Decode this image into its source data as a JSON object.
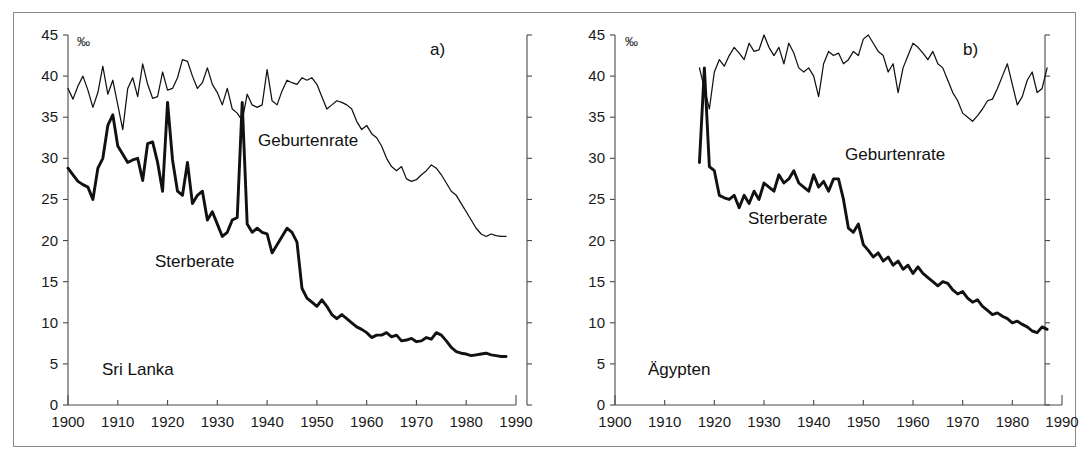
{
  "figure": {
    "unit_symbol": "‰",
    "panel_a_marker": "a)",
    "panel_b_marker": "b)",
    "series_label_birth": "Geburtenrate",
    "series_label_death": "Sterberate",
    "country_a": "Sri Lanka",
    "country_b": "Ägypten",
    "ink_color": "#111111",
    "axis_color": "#4a4a4a",
    "frame_color": "#8a8a8a",
    "background": "#ffffff"
  },
  "chart_data": [
    {
      "type": "line",
      "title": "Sri Lanka",
      "panel": "a)",
      "xlabel": "",
      "ylabel": "‰",
      "xlim": [
        1900,
        1990
      ],
      "ylim": [
        0,
        45
      ],
      "yticks": [
        0,
        5,
        10,
        15,
        20,
        25,
        30,
        35,
        40,
        45
      ],
      "xticks": [
        1900,
        1910,
        1920,
        1930,
        1940,
        1950,
        1960,
        1970,
        1980,
        1990
      ],
      "grid": false,
      "legend": "inline-annotation",
      "series": [
        {
          "name": "Geburtenrate",
          "x": [
            1900,
            1901,
            1902,
            1903,
            1904,
            1905,
            1906,
            1907,
            1908,
            1909,
            1910,
            1911,
            1912,
            1913,
            1914,
            1915,
            1916,
            1917,
            1918,
            1919,
            1920,
            1921,
            1922,
            1923,
            1924,
            1925,
            1926,
            1927,
            1928,
            1929,
            1930,
            1931,
            1932,
            1933,
            1934,
            1935,
            1936,
            1937,
            1938,
            1939,
            1940,
            1941,
            1942,
            1943,
            1944,
            1945,
            1946,
            1947,
            1948,
            1949,
            1950,
            1951,
            1952,
            1953,
            1954,
            1955,
            1956,
            1957,
            1958,
            1959,
            1960,
            1961,
            1962,
            1963,
            1964,
            1965,
            1966,
            1967,
            1968,
            1969,
            1970,
            1971,
            1972,
            1973,
            1974,
            1975,
            1976,
            1977,
            1978,
            1979,
            1980,
            1981,
            1982,
            1983,
            1984,
            1985,
            1986,
            1987,
            1988
          ],
          "values": [
            38.5,
            37.2,
            38.8,
            40.0,
            38.3,
            36.2,
            38.0,
            41.2,
            37.8,
            39.5,
            36.5,
            33.5,
            38.5,
            39.8,
            37.5,
            41.5,
            39.0,
            37.3,
            37.5,
            40.5,
            38.3,
            38.5,
            39.8,
            42.0,
            41.8,
            40.0,
            38.5,
            39.2,
            41.0,
            39.0,
            38.0,
            36.5,
            38.5,
            36.0,
            35.5,
            34.6,
            37.8,
            36.5,
            36.2,
            36.5,
            40.8,
            37.0,
            36.5,
            38.2,
            39.5,
            39.2,
            39.0,
            39.8,
            39.5,
            39.8,
            39.0,
            37.5,
            36.0,
            36.5,
            37.0,
            36.8,
            36.5,
            36.0,
            34.5,
            33.5,
            34.0,
            33.0,
            32.5,
            31.5,
            30.0,
            29.0,
            28.5,
            29.0,
            27.5,
            27.2,
            27.4,
            28.0,
            28.5,
            29.2,
            28.8,
            28.0,
            27.0,
            26.0,
            25.5,
            24.5,
            23.5,
            22.5,
            21.5,
            20.8,
            20.5,
            20.8,
            20.6,
            20.5,
            20.5
          ]
        },
        {
          "name": "Sterberate",
          "x": [
            1900,
            1901,
            1902,
            1903,
            1904,
            1905,
            1906,
            1907,
            1908,
            1909,
            1910,
            1911,
            1912,
            1913,
            1914,
            1915,
            1916,
            1917,
            1918,
            1919,
            1920,
            1921,
            1922,
            1923,
            1924,
            1925,
            1926,
            1927,
            1928,
            1929,
            1930,
            1931,
            1932,
            1933,
            1934,
            1935,
            1936,
            1937,
            1938,
            1939,
            1940,
            1941,
            1942,
            1943,
            1944,
            1945,
            1946,
            1947,
            1948,
            1949,
            1950,
            1951,
            1952,
            1953,
            1954,
            1955,
            1956,
            1957,
            1958,
            1959,
            1960,
            1961,
            1962,
            1963,
            1964,
            1965,
            1966,
            1967,
            1968,
            1969,
            1970,
            1971,
            1972,
            1973,
            1974,
            1975,
            1976,
            1977,
            1978,
            1979,
            1980,
            1981,
            1982,
            1983,
            1984,
            1985,
            1986,
            1987,
            1988
          ],
          "values": [
            28.8,
            28.0,
            27.2,
            26.8,
            26.5,
            25.0,
            28.8,
            30.0,
            34.0,
            35.3,
            31.5,
            30.5,
            29.5,
            29.8,
            30.0,
            27.3,
            31.8,
            32.0,
            29.5,
            26.0,
            36.8,
            29.8,
            26.0,
            25.5,
            29.5,
            24.5,
            25.5,
            26.0,
            22.5,
            23.5,
            22.0,
            20.5,
            21.0,
            22.5,
            22.8,
            36.8,
            22.0,
            21.0,
            21.5,
            21.0,
            20.8,
            18.5,
            19.5,
            20.5,
            21.5,
            21.0,
            19.8,
            14.2,
            13.0,
            12.5,
            12.0,
            12.8,
            12.0,
            11.0,
            10.5,
            11.0,
            10.5,
            10.0,
            9.5,
            9.2,
            8.8,
            8.2,
            8.5,
            8.5,
            8.8,
            8.3,
            8.5,
            7.8,
            7.9,
            8.1,
            7.7,
            7.8,
            8.2,
            8.0,
            8.8,
            8.5,
            7.8,
            7.0,
            6.5,
            6.3,
            6.2,
            6.0,
            6.1,
            6.2,
            6.3,
            6.1,
            6.0,
            5.9,
            5.9
          ]
        }
      ]
    },
    {
      "type": "line",
      "title": "Ägypten",
      "panel": "b)",
      "xlabel": "",
      "ylabel": "‰",
      "xlim": [
        1900,
        1990
      ],
      "ylim": [
        0,
        45
      ],
      "yticks": [
        0,
        5,
        10,
        15,
        20,
        25,
        30,
        35,
        40,
        45
      ],
      "xticks": [
        1900,
        1910,
        1920,
        1930,
        1940,
        1950,
        1960,
        1970,
        1980,
        1990
      ],
      "grid": false,
      "legend": "inline-annotation",
      "series": [
        {
          "name": "Geburtenrate",
          "x": [
            1917,
            1918,
            1919,
            1920,
            1921,
            1922,
            1923,
            1924,
            1925,
            1926,
            1927,
            1928,
            1929,
            1930,
            1931,
            1932,
            1933,
            1934,
            1935,
            1936,
            1937,
            1938,
            1939,
            1940,
            1941,
            1942,
            1943,
            1944,
            1945,
            1946,
            1947,
            1948,
            1949,
            1950,
            1951,
            1952,
            1953,
            1954,
            1955,
            1956,
            1957,
            1958,
            1959,
            1960,
            1961,
            1962,
            1963,
            1964,
            1965,
            1966,
            1967,
            1968,
            1969,
            1970,
            1971,
            1972,
            1973,
            1974,
            1975,
            1976,
            1977,
            1978,
            1979,
            1980,
            1981,
            1982,
            1983,
            1984,
            1985,
            1986,
            1987
          ],
          "values": [
            41.0,
            38.5,
            36.0,
            40.5,
            42.0,
            41.2,
            42.5,
            43.5,
            42.8,
            42.0,
            44.0,
            43.0,
            43.2,
            45.0,
            43.5,
            42.5,
            43.5,
            41.5,
            44.0,
            42.8,
            41.0,
            40.5,
            41.0,
            40.0,
            37.5,
            41.5,
            43.0,
            42.5,
            42.8,
            41.5,
            42.0,
            43.0,
            42.5,
            44.5,
            45.0,
            44.0,
            43.0,
            42.5,
            40.5,
            41.5,
            38.0,
            41.0,
            42.5,
            44.0,
            43.5,
            42.8,
            42.0,
            43.0,
            41.5,
            41.0,
            39.5,
            38.0,
            37.0,
            35.5,
            35.0,
            34.5,
            35.2,
            36.0,
            37.0,
            37.2,
            38.5,
            40.0,
            41.5,
            39.0,
            36.5,
            37.5,
            39.5,
            40.5,
            38.0,
            38.5,
            41.0
          ]
        },
        {
          "name": "Sterberate",
          "x": [
            1917,
            1918,
            1919,
            1920,
            1921,
            1922,
            1923,
            1924,
            1925,
            1926,
            1927,
            1928,
            1929,
            1930,
            1931,
            1932,
            1933,
            1934,
            1935,
            1936,
            1937,
            1938,
            1939,
            1940,
            1941,
            1942,
            1943,
            1944,
            1945,
            1946,
            1947,
            1948,
            1949,
            1950,
            1951,
            1952,
            1953,
            1954,
            1955,
            1956,
            1957,
            1958,
            1959,
            1960,
            1961,
            1962,
            1963,
            1964,
            1965,
            1966,
            1967,
            1968,
            1969,
            1970,
            1971,
            1972,
            1973,
            1974,
            1975,
            1976,
            1977,
            1978,
            1979,
            1980,
            1981,
            1982,
            1983,
            1984,
            1985,
            1986,
            1987
          ],
          "values": [
            29.5,
            41.0,
            29.0,
            28.5,
            25.5,
            25.2,
            25.0,
            25.5,
            24.0,
            25.5,
            24.5,
            26.0,
            25.0,
            27.0,
            26.5,
            26.0,
            28.0,
            27.0,
            27.5,
            28.5,
            27.0,
            26.5,
            26.0,
            28.0,
            26.5,
            27.2,
            26.0,
            27.5,
            27.5,
            25.0,
            21.5,
            21.0,
            22.0,
            19.5,
            18.8,
            18.0,
            18.5,
            17.5,
            18.0,
            17.0,
            17.5,
            16.5,
            17.0,
            16.0,
            16.8,
            16.0,
            15.5,
            15.0,
            14.5,
            15.0,
            14.8,
            14.0,
            13.5,
            13.8,
            13.0,
            12.5,
            12.8,
            12.0,
            11.5,
            11.0,
            11.2,
            10.8,
            10.5,
            10.0,
            10.2,
            9.8,
            9.5,
            9.0,
            8.8,
            9.5,
            9.2
          ]
        }
      ]
    }
  ]
}
